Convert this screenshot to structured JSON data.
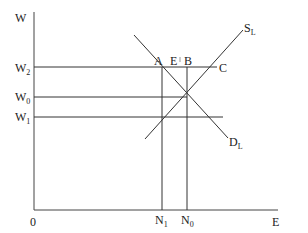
{
  "diagram": {
    "type": "labor-market-supply-demand",
    "axes": {
      "y_label": "W",
      "x_label": "E",
      "origin_label": "0"
    },
    "wage_levels": [
      {
        "id": "W2",
        "label": "W",
        "sub": "2"
      },
      {
        "id": "W0",
        "label": "W",
        "sub": "0"
      },
      {
        "id": "W1",
        "label": "W",
        "sub": "1"
      }
    ],
    "employment_levels": [
      {
        "id": "N1",
        "label": "N",
        "sub": "1"
      },
      {
        "id": "N0",
        "label": "N",
        "sub": "0"
      }
    ],
    "curves": {
      "supply": {
        "label": "S",
        "sub": "L"
      },
      "demand": {
        "label": "D",
        "sub": "L"
      }
    },
    "points": {
      "A": "A",
      "E": "E",
      "B": "B",
      "C": "C"
    }
  }
}
